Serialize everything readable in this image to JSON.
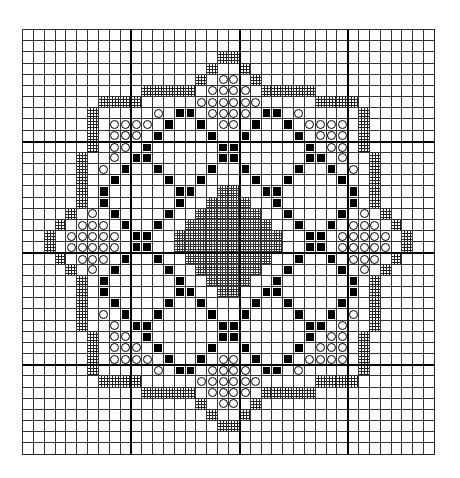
{
  "chart": {
    "title": "",
    "grid_columns": 38,
    "grid_rows": 38,
    "major_line_every": 10,
    "legend": {
      ".": "empty",
      "H": "cross-hatched border stitch",
      "O": "open circle stitch",
      "B": "solid black stitch",
      "D": "dense cross-hatched center fill"
    },
    "colors": {
      "ink": "#000000",
      "paper": "#ffffff",
      "grid": "#333333"
    },
    "rows": [
      "......................................",
      "......................................",
      "..................HH..................",
      ".................H..H.................",
      "................H.OO.H................",
      "...........HHHHH.OOOO.HHHHH...........",
      ".......HHHH.....OOOOOO.....HHHH.......",
      "......H.....O.BB.OOOO.BB.O.....H......",
      "......H.OOOO.B..B.OO.B..B.OOOO.H......",
      "......H.OOO.B....B..B....B.OOO.H......",
      "......H.OO.B......BB......B.OO.H......",
      ".....H..O.BB......BB......BB.O..H.....",
      ".....H.O.B..B....B..B....B..B.O.H.....",
      ".....H..B....B..B....B..B....B..H.....",
      ".....H.B......BB..DD..BB......B.H.....",
      ".....H.B......B..DDDD..B......B.H.....",
      "....H.O.B....B..DDDDDD..B....B.O.H....",
      "...H.OOO.B..B..DDDDDDDD..B..B.OOO.H...",
      "..H.OOOOO.BB..DDDDDDDDDD..BB.OOOOO.H..",
      "..H.OOOOO.BB..DDDDDDDDDD..BB.OOOOO.H..",
      "...H.OOO.B..B..DDDDDDDD..B..B.OOO.H...",
      "....H.O.B....B..DDDDDD..B....B.O.H....",
      ".....H.B......B..DDDD..B......B.H.....",
      ".....H.B......BB..DD..BB......B.H.....",
      ".....H..B....B..B....B..B....B..H.....",
      ".....H.O.B..B....B..B....B..B.O.H.....",
      ".....H..O.BB......BB......BB.O..H.....",
      "......H.OO.B......BB......B.OO.H......",
      "......H.OOO.B....B..B....B.OOO.H......",
      "......H.OOOO.B..B.OO.B..B.OOOO.H......",
      "......H.....O.BB.OOOO.BB.O.....H......",
      ".......HHHH.....OOOOOO.....HHHH.......",
      "...........HHHHH.OOOO.HHHHH...........",
      "................H.OO.H................",
      ".................H..H.................",
      "..................HH..................",
      "......................................",
      "......................................"
    ]
  }
}
